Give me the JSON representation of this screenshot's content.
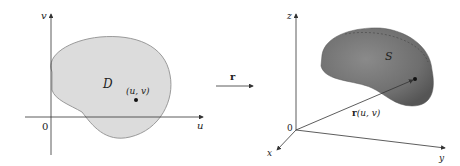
{
  "left_panel": {
    "axis_u_label": "u",
    "axis_v_label": "v",
    "origin_label": "0",
    "region_label": "D",
    "point_label": "(u, v)"
  },
  "mapping": {
    "arrow_label": "r"
  },
  "right_panel": {
    "axis_x_label": "x",
    "axis_y_label": "y",
    "axis_z_label": "z",
    "origin_label": "0",
    "surface_label": "S",
    "vector_label_bold": "r",
    "vector_label_rest": "(u, v)"
  },
  "colors": {
    "region_fill": "#dcdcdc",
    "region_stroke": "#9a9a9a",
    "surface_fill": "#7a7a7a",
    "surface_dark": "#5a5a5a",
    "axis": "#333333"
  }
}
